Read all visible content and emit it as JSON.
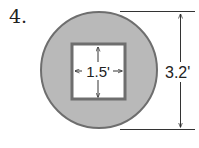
{
  "problem_number": "4.",
  "figure": {
    "shape": "circle with square hole",
    "inner_square_label": "1.5'",
    "outer_diameter_label": "3.2'",
    "colors": {
      "fill": "#b9b9b9",
      "outline": "#6e6e6e",
      "hole": "#ffffff",
      "lines": "#333333"
    }
  }
}
